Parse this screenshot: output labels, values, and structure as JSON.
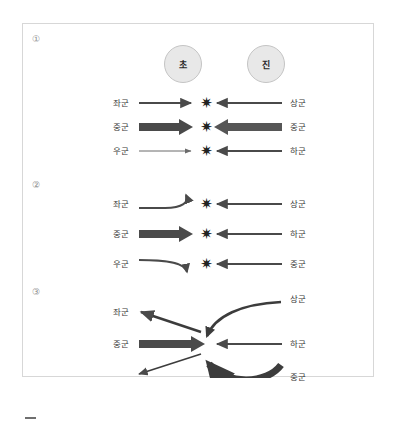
{
  "figure": {
    "frame_border_color": "#d7d7d7",
    "arrow_color": "#4a4a4a",
    "arrow_color_dark": "#3c3c3c",
    "label_color": "#3a3a3a",
    "circle_fill": "#e8e8e8",
    "circle_border": "#c4c4c4"
  },
  "circles": [
    {
      "name": "circle-cho",
      "label": "초"
    },
    {
      "name": "circle-jin",
      "label": "진"
    }
  ],
  "sections": [
    {
      "index": "①",
      "rows": [
        {
          "left_label": "좌군",
          "right_label": "상군",
          "left_arrow": "straight-medium",
          "right_arrow": "straight-medium",
          "clash": "✷"
        },
        {
          "left_label": "중군",
          "right_label": "중군",
          "left_arrow": "block-thick",
          "right_arrow": "block-thick",
          "clash": "✷"
        },
        {
          "left_label": "우군",
          "right_label": "하군",
          "left_arrow": "straight-thin",
          "right_arrow": "straight-medium",
          "clash": "✷"
        }
      ]
    },
    {
      "index": "②",
      "rows": [
        {
          "left_label": "좌군",
          "right_label": "상군",
          "left_arrow": "curve-up",
          "right_arrow": "straight-medium",
          "clash": "✷"
        },
        {
          "left_label": "중군",
          "right_label": "하군",
          "left_arrow": "block-thick",
          "right_arrow": "straight-medium",
          "clash": "✷"
        },
        {
          "left_label": "우군",
          "right_label": "중군",
          "left_arrow": "curve-down",
          "right_arrow": "straight-medium",
          "clash": "✷"
        }
      ]
    },
    {
      "index": "③",
      "rows": [
        {
          "left_label": "좌군",
          "right_label": "상군",
          "left_arrow": "diagonal-up-left",
          "right_arrow": "curve-sweep-down"
        },
        {
          "left_label": "중군",
          "right_label": "하군",
          "left_arrow": "block-thick",
          "right_arrow": "straight-medium"
        },
        {
          "left_label": "",
          "right_label": "중군",
          "left_arrow": "diagonal-down-left",
          "right_arrow": "curve-sweep-up-thick"
        }
      ]
    }
  ],
  "page_mark": {
    "name": "page-dash",
    "label": ""
  }
}
